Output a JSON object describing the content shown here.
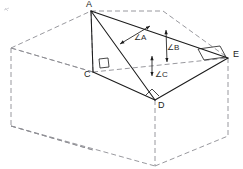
{
  "figure": {
    "type": "geometry-diagram",
    "canvas": {
      "width": 243,
      "height": 169,
      "background": "#ffffff"
    },
    "colors": {
      "solid_stroke": "#1b1b1b",
      "dashed_stroke": "#8d8d93",
      "label_text": "#1b1b1b",
      "angle_text": "#2a2a2a"
    },
    "stroke_widths": {
      "solid": 1.0,
      "dashed": 0.9,
      "marker": 0.8
    },
    "dash_pattern": "5,3"
  },
  "vertices": [
    {
      "id": "A",
      "label": "A",
      "x": 91,
      "y": 11,
      "label_x": 86,
      "label_y": 0,
      "kind": "apex"
    },
    {
      "id": "C",
      "label": "C",
      "x": 93,
      "y": 72,
      "label_x": 84,
      "label_y": 70,
      "kind": "foot-of-perpendicular"
    },
    {
      "id": "D",
      "label": "D",
      "x": 155,
      "y": 100,
      "label_x": 158,
      "label_y": 101,
      "kind": "base-front"
    },
    {
      "id": "E",
      "label": "E",
      "x": 228,
      "y": 58,
      "label_x": 233,
      "label_y": 50,
      "kind": "base-right"
    }
  ],
  "solid_edges": [
    {
      "name": "edge-A-E",
      "from": "A",
      "to": "E"
    },
    {
      "name": "edge-A-D",
      "from": "A",
      "to": "D"
    },
    {
      "name": "edge-D-E",
      "from": "D",
      "to": "E"
    },
    {
      "name": "edge-A-C",
      "from": "A",
      "to": "C"
    },
    {
      "name": "edge-C-D",
      "from": "C",
      "to": "D"
    }
  ],
  "dashed_edges": [
    {
      "name": "box-top-left-back",
      "x1": 11,
      "y1": 48,
      "x2": 91,
      "y2": 11
    },
    {
      "name": "box-top-back-right",
      "x1": 91,
      "y1": 11,
      "x2": 163,
      "y2": 11
    },
    {
      "name": "box-top-right-edge",
      "x1": 163,
      "y1": 11,
      "x2": 228,
      "y2": 58
    },
    {
      "name": "box-top-front-left",
      "x1": 11,
      "y1": 48,
      "x2": 93,
      "y2": 72
    },
    {
      "name": "box-top-front-right",
      "x1": 93,
      "y1": 72,
      "x2": 228,
      "y2": 58
    },
    {
      "name": "box-vert-left",
      "x1": 11,
      "y1": 48,
      "x2": 11,
      "y2": 126
    },
    {
      "name": "box-vert-right",
      "x1": 228,
      "y1": 58,
      "x2": 228,
      "y2": 136
    },
    {
      "name": "box-vert-front",
      "x1": 155,
      "y1": 100,
      "x2": 155,
      "y2": 166
    },
    {
      "name": "box-vert-apex",
      "x1": 91,
      "y1": 11,
      "x2": 93,
      "y2": 72
    },
    {
      "name": "box-bot-left-back",
      "x1": 11,
      "y1": 126,
      "x2": 93,
      "y2": 150
    },
    {
      "name": "box-bot-front-left",
      "x1": 11,
      "y1": 126,
      "x2": 93,
      "y2": 150
    },
    {
      "name": "box-bot-left-to-front",
      "x1": 11,
      "y1": 126,
      "x2": 155,
      "y2": 166
    },
    {
      "name": "box-bot-front-to-right",
      "x1": 155,
      "y1": 166,
      "x2": 228,
      "y2": 136
    },
    {
      "name": "box-inner-C-to-left",
      "x1": 93,
      "y1": 72,
      "x2": 11,
      "y2": 48
    }
  ],
  "right_angle_markers": [
    {
      "name": "right-angle-at-C",
      "style": "square",
      "x": 99,
      "y": 59,
      "size": 9,
      "rotation": 0
    },
    {
      "name": "right-angle-at-D",
      "style": "small-corner",
      "x": 152,
      "y": 89,
      "size": 7,
      "rotation": 0
    },
    {
      "name": "right-angle-at-E",
      "style": "parallelogram",
      "x": 198,
      "y": 46,
      "size": 22,
      "rotation": 0
    }
  ],
  "angle_annotations": [
    {
      "id": "angle-A",
      "label": "A",
      "label_x": 134,
      "label_y": 34,
      "description": "angle at apex A between AD and AE, double-headed arrow across the face",
      "arrow": {
        "x1": 120,
        "y1": 44,
        "x2": 150,
        "y2": 26
      }
    },
    {
      "id": "angle-B",
      "label": "B",
      "label_x": 167,
      "label_y": 44,
      "description": "angle B marked vertically between top edge AE and dashed plane line",
      "arrow": {
        "x1": 166,
        "y1": 30,
        "x2": 167,
        "y2": 62
      }
    },
    {
      "id": "angle-C",
      "label": "C",
      "label_x": 155,
      "label_y": 71,
      "description": "angle C measured vertically from dashed base plane down toward D",
      "arrow": {
        "x1": 152,
        "y1": 56,
        "x2": 152,
        "y2": 76
      }
    }
  ],
  "vertex_label_list": [
    "A",
    "C",
    "D",
    "E"
  ],
  "angle_label_list": [
    "A",
    "B",
    "C"
  ]
}
